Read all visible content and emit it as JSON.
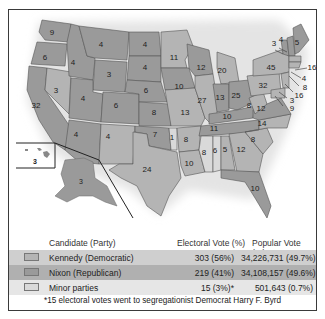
{
  "colors": {
    "democratic": "#b4b4b4",
    "republican": "#9a9a9a",
    "minor": "#d6d6d6",
    "ocean_shadow": "#e8e8e8",
    "border": "#3a3a3a"
  },
  "map": {
    "states": [
      {
        "abbr": "WA",
        "votes": "9",
        "party": "republican"
      },
      {
        "abbr": "OR",
        "votes": "6",
        "party": "republican"
      },
      {
        "abbr": "CA",
        "votes": "32",
        "party": "republican"
      },
      {
        "abbr": "NV",
        "votes": "3",
        "party": "democratic"
      },
      {
        "abbr": "ID",
        "votes": "4",
        "party": "republican"
      },
      {
        "abbr": "MT",
        "votes": "4",
        "party": "republican"
      },
      {
        "abbr": "WY",
        "votes": "3",
        "party": "republican"
      },
      {
        "abbr": "UT",
        "votes": "4",
        "party": "republican"
      },
      {
        "abbr": "AZ",
        "votes": "4",
        "party": "republican"
      },
      {
        "abbr": "CO",
        "votes": "6",
        "party": "republican"
      },
      {
        "abbr": "NM",
        "votes": "4",
        "party": "democratic"
      },
      {
        "abbr": "ND",
        "votes": "4",
        "party": "republican"
      },
      {
        "abbr": "SD",
        "votes": "4",
        "party": "republican"
      },
      {
        "abbr": "NE",
        "votes": "6",
        "party": "republican"
      },
      {
        "abbr": "KS",
        "votes": "8",
        "party": "republican"
      },
      {
        "abbr": "OK",
        "votes": "7",
        "party": "republican"
      },
      {
        "abbr": "OK-minor",
        "votes": "1",
        "party": "minor"
      },
      {
        "abbr": "TX",
        "votes": "24",
        "party": "democratic"
      },
      {
        "abbr": "MN",
        "votes": "11",
        "party": "democratic"
      },
      {
        "abbr": "IA",
        "votes": "10",
        "party": "republican"
      },
      {
        "abbr": "MO",
        "votes": "13",
        "party": "democratic"
      },
      {
        "abbr": "AR",
        "votes": "8",
        "party": "democratic"
      },
      {
        "abbr": "LA",
        "votes": "10",
        "party": "democratic"
      },
      {
        "abbr": "WI",
        "votes": "12",
        "party": "republican"
      },
      {
        "abbr": "IL",
        "votes": "27",
        "party": "democratic"
      },
      {
        "abbr": "MI",
        "votes": "20",
        "party": "democratic"
      },
      {
        "abbr": "IN",
        "votes": "13",
        "party": "republican"
      },
      {
        "abbr": "OH",
        "votes": "25",
        "party": "republican"
      },
      {
        "abbr": "KY",
        "votes": "10",
        "party": "republican"
      },
      {
        "abbr": "TN",
        "votes": "11",
        "party": "republican"
      },
      {
        "abbr": "MS",
        "votes": "8",
        "party": "minor"
      },
      {
        "abbr": "AL",
        "votes": "6",
        "party": "minor"
      },
      {
        "abbr": "AL-dem",
        "votes": "5",
        "party": "democratic"
      },
      {
        "abbr": "GA",
        "votes": "12",
        "party": "democratic"
      },
      {
        "abbr": "FL",
        "votes": "10",
        "party": "republican"
      },
      {
        "abbr": "SC",
        "votes": "8",
        "party": "democratic"
      },
      {
        "abbr": "NC",
        "votes": "14",
        "party": "democratic"
      },
      {
        "abbr": "VA",
        "votes": "12",
        "party": "republican"
      },
      {
        "abbr": "WV",
        "votes": "8",
        "party": "democratic"
      },
      {
        "abbr": "PA",
        "votes": "32",
        "party": "democratic"
      },
      {
        "abbr": "NY",
        "votes": "45",
        "party": "democratic"
      },
      {
        "abbr": "VT",
        "votes": "3",
        "party": "republican"
      },
      {
        "abbr": "NH",
        "votes": "4",
        "party": "republican"
      },
      {
        "abbr": "ME",
        "votes": "5",
        "party": "republican"
      },
      {
        "abbr": "MA",
        "votes": "16",
        "party": "democratic"
      },
      {
        "abbr": "RI",
        "votes": "4",
        "party": "democratic"
      },
      {
        "abbr": "CT",
        "votes": "8",
        "party": "democratic"
      },
      {
        "abbr": "NJ",
        "votes": "16",
        "party": "democratic"
      },
      {
        "abbr": "DE",
        "votes": "3",
        "party": "democratic"
      },
      {
        "abbr": "MD",
        "votes": "9",
        "party": "democratic"
      },
      {
        "abbr": "HI",
        "votes": "3",
        "party": "democratic"
      },
      {
        "abbr": "AK",
        "votes": "3",
        "party": "republican"
      }
    ]
  },
  "legend": {
    "headers": {
      "candidate": "Candidate (Party)",
      "electoral": "Electoral Vote (%)",
      "popular": "Popular Vote (%)"
    },
    "rows": [
      {
        "candidate": "Kennedy (Democratic)",
        "electoral": "303 (56%)",
        "popular": "34,226,731 (49.7%)",
        "swatch": "#b4b4b4",
        "row_bg": "#cfcfcf"
      },
      {
        "candidate": "Nixon (Republican)",
        "electoral": "219 (41%)",
        "popular": "34,108,157 (49.6%)",
        "swatch": "#9a9a9a",
        "row_bg": "#b0b0b0"
      },
      {
        "candidate": "Minor parties",
        "electoral": "15 (3%)*",
        "popular": "501,643 (0.7%)",
        "swatch": "#d9d9d9",
        "row_bg": "#e6e6e6"
      }
    ],
    "footnote": "*15 electoral votes went to segregationist Democrat Harry F. Byrd"
  }
}
